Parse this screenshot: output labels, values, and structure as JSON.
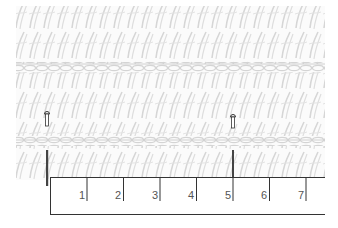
{
  "figure": {
    "fabric": {
      "rows_of_stitches": 4,
      "chain_divider_rows": 2,
      "stitch_color": "#d8d8d8",
      "background_color": "#ffffff"
    },
    "pins": [
      {
        "name": "left-pin",
        "x": 47
      },
      {
        "name": "right-pin",
        "x": 233
      }
    ],
    "ruler": {
      "labels": [
        "1",
        "2",
        "3",
        "4",
        "5",
        "6",
        "7"
      ],
      "line_color": "#333333"
    }
  }
}
